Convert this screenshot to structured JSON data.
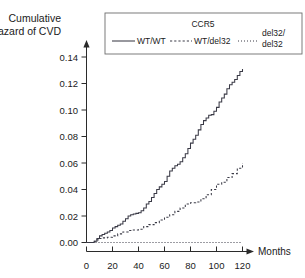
{
  "chart_data": {
    "type": "line",
    "title": "",
    "xlabel": "Months",
    "ylabel": "Cumulative Hazard of CVD",
    "ylabel_line1": "Cumulative",
    "ylabel_line2": "Hazard of CVD",
    "xlim": [
      0,
      128
    ],
    "ylim": [
      0.0,
      0.145
    ],
    "grid": false,
    "legend_position": "top",
    "legend_title": "CCR5",
    "xticks": [
      0,
      20,
      40,
      60,
      80,
      100,
      120
    ],
    "xtick_labels": [
      "0",
      "20",
      "40",
      "60",
      "80",
      "100",
      "120"
    ],
    "yticks": [
      0.0,
      0.02,
      0.04,
      0.06,
      0.08,
      0.1,
      0.12,
      0.14
    ],
    "ytick_labels": [
      "0.00",
      "0.02",
      "0.04",
      "0.06",
      "0.08",
      "0.10",
      "0.12",
      "0.14"
    ],
    "series": [
      {
        "name": "WT/WT",
        "style": "solid",
        "step": true,
        "x": [
          0,
          4,
          6,
          8,
          10,
          12,
          14,
          16,
          18,
          20,
          22,
          24,
          26,
          28,
          30,
          32,
          34,
          36,
          38,
          40,
          42,
          44,
          46,
          48,
          50,
          52,
          54,
          56,
          58,
          60,
          62,
          64,
          66,
          68,
          70,
          72,
          74,
          76,
          78,
          80,
          82,
          84,
          86,
          88,
          90,
          92,
          94,
          96,
          98,
          100,
          102,
          104,
          106,
          108,
          110,
          112,
          114,
          116,
          118,
          120
        ],
        "y": [
          0.0,
          0.0,
          0.001,
          0.003,
          0.005,
          0.006,
          0.007,
          0.008,
          0.009,
          0.011,
          0.012,
          0.013,
          0.014,
          0.016,
          0.018,
          0.02,
          0.021,
          0.0215,
          0.022,
          0.0225,
          0.024,
          0.026,
          0.029,
          0.031,
          0.034,
          0.037,
          0.04,
          0.042,
          0.044,
          0.046,
          0.05,
          0.054,
          0.056,
          0.058,
          0.059,
          0.061,
          0.064,
          0.067,
          0.071,
          0.075,
          0.078,
          0.081,
          0.085,
          0.089,
          0.092,
          0.094,
          0.096,
          0.0965,
          0.099,
          0.102,
          0.106,
          0.109,
          0.112,
          0.116,
          0.119,
          0.121,
          0.123,
          0.126,
          0.129,
          0.131
        ]
      },
      {
        "name": "WT/del32",
        "style": "dashed",
        "step": true,
        "x": [
          0,
          4,
          6,
          8,
          10,
          12,
          16,
          20,
          24,
          28,
          32,
          36,
          40,
          44,
          48,
          52,
          56,
          60,
          64,
          68,
          72,
          76,
          80,
          84,
          88,
          92,
          96,
          100,
          104,
          108,
          112,
          116,
          120
        ],
        "y": [
          0.0,
          0.0,
          0.001,
          0.002,
          0.003,
          0.0035,
          0.004,
          0.005,
          0.0065,
          0.008,
          0.009,
          0.0095,
          0.01,
          0.012,
          0.0135,
          0.015,
          0.017,
          0.019,
          0.021,
          0.0235,
          0.026,
          0.029,
          0.03,
          0.0305,
          0.033,
          0.036,
          0.04,
          0.044,
          0.0455,
          0.049,
          0.052,
          0.056,
          0.06
        ]
      },
      {
        "name": "del32/del32",
        "name_line1": "del32/",
        "name_line2": "del32",
        "style": "dotted",
        "step": true,
        "x": [
          0,
          120
        ],
        "y": [
          0.0,
          0.0
        ]
      }
    ]
  },
  "legend": {
    "title": "CCR5",
    "entries": [
      {
        "label": "WT/WT",
        "style": "solid"
      },
      {
        "label": "WT/del32",
        "style": "dashed"
      },
      {
        "label_line1": "del32/",
        "label_line2": "del32",
        "style": "dotted"
      }
    ]
  },
  "axes": {
    "y_title_line1": "Cumulative",
    "y_title_line2": "Hazard of CVD",
    "x_title": "Months"
  },
  "colors": {
    "curve": "#3a3a46",
    "axis": "#2b2b2b",
    "text": "#1a1a1a",
    "legend_border": "#6d6d6d",
    "background": "#ffffff"
  }
}
